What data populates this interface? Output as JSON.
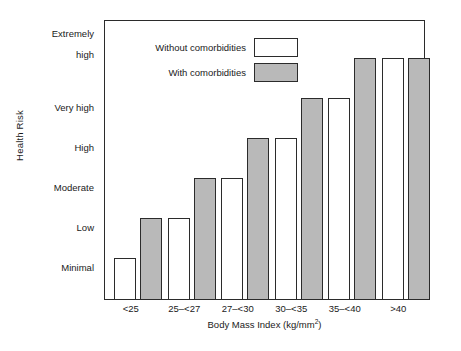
{
  "chart_data": {
    "type": "bar",
    "title": "",
    "xlabel": "Body Mass Index (kg/mm2)",
    "xlabel_base": "Body Mass Index (kg/mm",
    "xlabel_sup": "2",
    "xlabel_tail": ")",
    "ylabel": "Health Risk",
    "categories": [
      "<25",
      "25–<27",
      "27–<30",
      "30–<35",
      "35–<40",
      ">40"
    ],
    "y_tick_labels": [
      "Extremely\nhigh",
      "Very high",
      "High",
      "Moderate",
      "Low",
      "Minimal"
    ],
    "y_scale_levels": [
      "Minimal",
      "Low",
      "Moderate",
      "High",
      "Very high",
      "Extremely high"
    ],
    "ylim": [
      0,
      6.25
    ],
    "grid": false,
    "legend_position": "top-left-inside",
    "series": [
      {
        "name": "Without comorbidities",
        "color": "#ffffff",
        "values": [
          1,
          2,
          3,
          4,
          5,
          6
        ],
        "value_labels": [
          "Minimal",
          "Low",
          "Moderate",
          "High",
          "Very high",
          "Extremely high"
        ]
      },
      {
        "name": "With comorbidities",
        "color": "#b9b9b9",
        "values": [
          2,
          3,
          4,
          5,
          6,
          6
        ],
        "value_labels": [
          "Low",
          "Moderate",
          "High",
          "Very high",
          "Extremely high",
          "Extremely high"
        ]
      }
    ]
  },
  "legend": {
    "items": [
      {
        "label": "Without comorbidities",
        "swatch": "white"
      },
      {
        "label": "With comorbidities",
        "swatch": "gray"
      }
    ]
  },
  "axes": {
    "y_title": "Health Risk",
    "x_title_base": "Body Mass Index (kg/mm",
    "x_title_sup": "2",
    "x_title_tail": ")",
    "y_ticks": [
      {
        "line1": "Extremely",
        "line2": "high"
      },
      {
        "line1": "Very high",
        "line2": ""
      },
      {
        "line1": "High",
        "line2": ""
      },
      {
        "line1": "Moderate",
        "line2": ""
      },
      {
        "line1": "Low",
        "line2": ""
      },
      {
        "line1": "Minimal",
        "line2": ""
      }
    ],
    "x_ticks": [
      "<25",
      "25–<27",
      "27–<30",
      "30–<35",
      "35–<40",
      ">40"
    ]
  },
  "colors": {
    "bar_without": "#ffffff",
    "bar_with": "#b9b9b9",
    "outline": "#2b2b2b",
    "background": "#ffffff",
    "text": "#1a1a1a"
  }
}
